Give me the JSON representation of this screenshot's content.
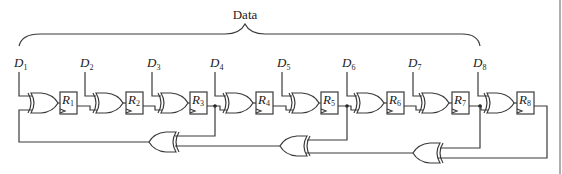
{
  "diagram": {
    "title": "Data",
    "inputs": [
      {
        "letter": "D",
        "sub": "1"
      },
      {
        "letter": "D",
        "sub": "2"
      },
      {
        "letter": "D",
        "sub": "3"
      },
      {
        "letter": "D",
        "sub": "4"
      },
      {
        "letter": "D",
        "sub": "5"
      },
      {
        "letter": "D",
        "sub": "6"
      },
      {
        "letter": "D",
        "sub": "7"
      },
      {
        "letter": "D",
        "sub": "8"
      }
    ],
    "registers": [
      {
        "letter": "R",
        "sub": "1"
      },
      {
        "letter": "R",
        "sub": "2"
      },
      {
        "letter": "R",
        "sub": "3"
      },
      {
        "letter": "R",
        "sub": "4"
      },
      {
        "letter": "R",
        "sub": "5"
      },
      {
        "letter": "R",
        "sub": "6"
      },
      {
        "letter": "R",
        "sub": "7"
      },
      {
        "letter": "R",
        "sub": "8"
      }
    ],
    "feedback_taps": [
      "R3",
      "R5",
      "R7",
      "R8"
    ],
    "line_color": "#3a3a3a"
  }
}
